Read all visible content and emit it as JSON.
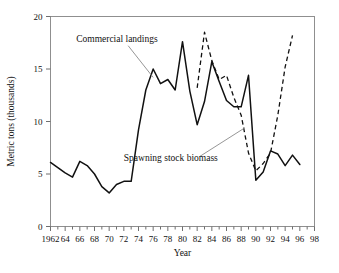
{
  "chart_data": {
    "type": "line",
    "title": "",
    "xlabel": "Year",
    "ylabel": "Metric tons (thousands)",
    "xlim": [
      1962,
      1998
    ],
    "ylim": [
      0,
      20
    ],
    "yticks": [
      0,
      5,
      10,
      15,
      20
    ],
    "xticks": [
      1962,
      1964,
      1966,
      1968,
      1970,
      1972,
      1974,
      1976,
      1978,
      1980,
      1982,
      1984,
      1986,
      1988,
      1990,
      1992,
      1994,
      1996,
      1998
    ],
    "xticklabels": [
      "1962",
      "64",
      "66",
      "68",
      "70",
      "72",
      "74",
      "76",
      "78",
      "80",
      "82",
      "84",
      "86",
      "88",
      "90",
      "92",
      "94",
      "96",
      "98"
    ],
    "yticklabels": [
      "0",
      "5",
      "10",
      "15",
      "20"
    ],
    "xtick_minor_every": 1,
    "grid": false,
    "legend": "none",
    "annotations": [
      {
        "text": "Commercial landings",
        "x": 1965.5,
        "y": 17.6,
        "points_to": {
          "x": 1976.0,
          "y": 14.2
        }
      },
      {
        "text": "Spawning stock biomass",
        "x": 1972.0,
        "y": 6.2,
        "points_to": {
          "x": 1988.5,
          "y": 9.4
        }
      }
    ],
    "series": [
      {
        "name": "Commercial landings",
        "style": "solid",
        "color": "#111111",
        "x": [
          1962,
          1963,
          1964,
          1965,
          1966,
          1967,
          1968,
          1969,
          1970,
          1971,
          1972,
          1973,
          1974,
          1975,
          1976,
          1977,
          1978,
          1979,
          1980,
          1981,
          1982,
          1983,
          1984,
          1985,
          1986,
          1987,
          1988,
          1989,
          1990,
          1991,
          1992,
          1993,
          1994,
          1995,
          1996
        ],
        "y": [
          6.1,
          5.6,
          5.1,
          4.7,
          6.2,
          5.8,
          5.0,
          3.8,
          3.2,
          4.0,
          4.3,
          4.3,
          9.2,
          13.0,
          15.0,
          13.6,
          14.0,
          13.0,
          17.6,
          12.9,
          9.7,
          11.9,
          15.7,
          13.8,
          12.0,
          11.4,
          11.4,
          14.4,
          4.4,
          5.2,
          7.2,
          6.9,
          5.8,
          6.8,
          5.9
        ]
      },
      {
        "name": "Spawning stock biomass",
        "style": "dashed",
        "color": "#111111",
        "x": [
          1982,
          1983,
          1984,
          1985,
          1986,
          1987,
          1988,
          1989,
          1990,
          1991,
          1992,
          1993,
          1994,
          1995
        ],
        "y": [
          13.2,
          18.5,
          15.8,
          14.0,
          14.4,
          12.3,
          10.6,
          7.0,
          5.3,
          6.0,
          7.0,
          10.6,
          15.2,
          18.2
        ]
      }
    ]
  }
}
